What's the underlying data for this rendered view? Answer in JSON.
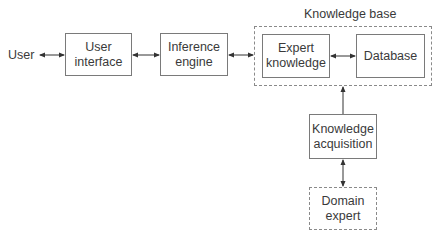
{
  "diagram": {
    "title": "Knowledge base",
    "nodes": {
      "user": {
        "label": "User"
      },
      "user_interface": {
        "line1": "User",
        "line2": "interface"
      },
      "inference_engine": {
        "line1": "Inference",
        "line2": "engine"
      },
      "expert_knowledge": {
        "line1": "Expert",
        "line2": "knowledge"
      },
      "database": {
        "label": "Database"
      },
      "knowledge_acquisition": {
        "line1": "Knowledge",
        "line2": "acquisition"
      },
      "domain_expert": {
        "line1": "Domain",
        "line2": "expert"
      }
    },
    "edges": [
      {
        "from": "User",
        "to": "User interface",
        "type": "bidirectional"
      },
      {
        "from": "User interface",
        "to": "Inference engine",
        "type": "bidirectional"
      },
      {
        "from": "Inference engine",
        "to": "Knowledge base",
        "type": "bidirectional"
      },
      {
        "from": "Expert knowledge",
        "to": "Database",
        "type": "bidirectional"
      },
      {
        "from": "Knowledge acquisition",
        "to": "Knowledge base",
        "type": "directed"
      },
      {
        "from": "Knowledge acquisition",
        "to": "Domain expert",
        "type": "bidirectional"
      }
    ],
    "colors": {
      "line": "#333333",
      "box_border": "#7a7a7a",
      "dashed_border": "#8a8a8a"
    }
  }
}
